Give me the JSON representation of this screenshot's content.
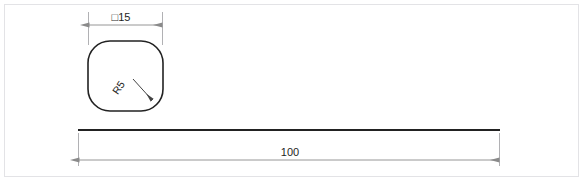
{
  "drawing": {
    "title": "Square bar profile technical drawing",
    "background_color": "#ffffff",
    "frame": {
      "name": "drawing-border",
      "color": "#e3e3e6",
      "x": 4,
      "y": 4,
      "width": 575,
      "height": 173
    },
    "colors": {
      "object_line": "#222222",
      "dimension_line": "#8a8a8a",
      "extension_line": "#a8a8ac",
      "text": "#1e1e1e",
      "frame": "#e3e3e6"
    },
    "views": [
      {
        "id": "end-view",
        "name": "end-view-rounded-square",
        "description": "End view: rounded square profile",
        "shape": "rounded-square",
        "x": 88,
        "y": 41,
        "width": 75,
        "height": 70,
        "corner_radius": 22,
        "stroke_width": 1.6
      },
      {
        "id": "side-view",
        "name": "side-view-bar",
        "description": "Side view: long thin bar",
        "shape": "thin-bar",
        "x1": 78,
        "x2": 500,
        "y": 130,
        "stroke_width": 2.0
      }
    ],
    "dimensions": [
      {
        "id": "width-dim",
        "name": "dimension-square-15",
        "label": "□15",
        "value": 15,
        "symbol": "square",
        "symbol_meaning": "square cross-section",
        "unit": "",
        "orientation": "horizontal",
        "line_y": 25,
        "x1": 88,
        "x2": 163,
        "text_x": 117,
        "text_y": 19,
        "applies_to": "end-view-rounded-square"
      },
      {
        "id": "length-dim",
        "name": "dimension-length-100",
        "label": "100",
        "value": 100,
        "symbol": "",
        "unit": "",
        "orientation": "horizontal",
        "line_y": 160,
        "x1": 78,
        "x2": 500,
        "text_x": 289,
        "text_y": 157,
        "applies_to": "side-view-bar"
      }
    ],
    "callouts": [
      {
        "id": "radius-callout",
        "name": "callout-radius-r5",
        "label": "R5",
        "value": 5,
        "prefix": "R",
        "meaning": "corner fillet radius",
        "rotation_deg": -55,
        "text_x": 137,
        "text_y": 84,
        "leader_from_x": 131,
        "leader_from_y": 77,
        "leader_to_x": 151,
        "leader_to_y": 99,
        "applies_to": "end-view-rounded-square"
      }
    ]
  }
}
